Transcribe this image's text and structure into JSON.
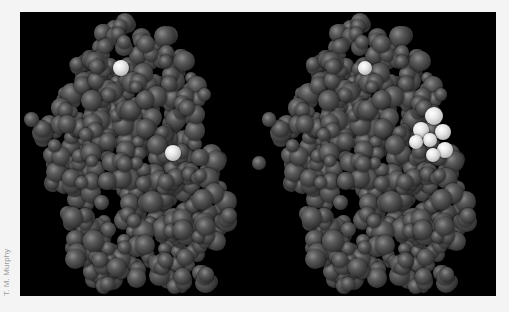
{
  "image": {
    "description": "Stereo pair of a protein space-filling model; dark gray atoms with highlighted light atoms",
    "background_color": "#000000",
    "atom_color": "#4a4a4a",
    "highlight_color": "#e6e6e6"
  },
  "credit": "T. M. Murphy",
  "molecules": [
    {
      "name": "left-view",
      "offset_x": 0,
      "highlights": [
        {
          "x": 101,
          "y": 56,
          "r": 8
        },
        {
          "x": 153,
          "y": 141,
          "r": 8
        }
      ]
    },
    {
      "name": "right-view",
      "offset_x": 238,
      "highlights": [
        {
          "x": 107,
          "y": 56,
          "r": 7
        },
        {
          "x": 176,
          "y": 104,
          "r": 9
        },
        {
          "x": 185,
          "y": 120,
          "r": 8
        },
        {
          "x": 163,
          "y": 118,
          "r": 8
        },
        {
          "x": 172,
          "y": 128,
          "r": 7
        },
        {
          "x": 158,
          "y": 130,
          "r": 7
        },
        {
          "x": 187,
          "y": 138,
          "r": 8
        },
        {
          "x": 175,
          "y": 143,
          "r": 7
        }
      ],
      "stray_atom": {
        "x": 1,
        "y": 151,
        "r": 7
      }
    }
  ]
}
